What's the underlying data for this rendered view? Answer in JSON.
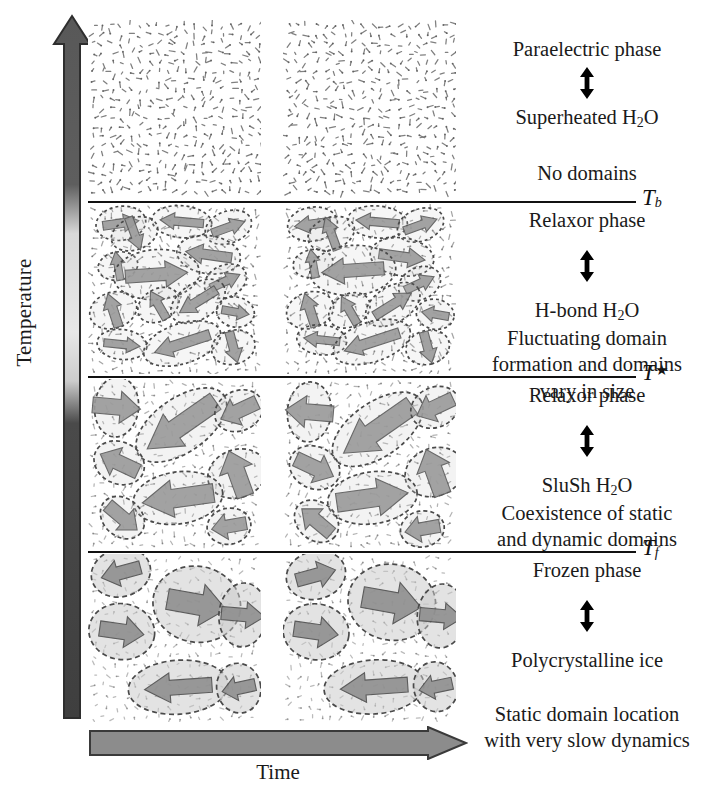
{
  "axes": {
    "temperature_label": "Temperature",
    "time_label": "Time",
    "temperature_arrow_direction": "up",
    "time_arrow_direction": "right",
    "arrow_fill": "#8c8c8c",
    "arrow_stroke": "#3a3a3a",
    "gradient_stops": [
      {
        "pos": 0,
        "color": "#585858"
      },
      {
        "pos": 24,
        "color": "#5e5e5e"
      },
      {
        "pos": 31,
        "color": "#d8d8d8"
      },
      {
        "pos": 45,
        "color": "#e8e8e8"
      },
      {
        "pos": 52,
        "color": "#cccccc"
      },
      {
        "pos": 58,
        "color": "#4a4a4a"
      },
      {
        "pos": 100,
        "color": "#3f3f3f"
      }
    ]
  },
  "boundaries": [
    {
      "id": "Tb",
      "symbol": "T",
      "subscript": "b",
      "superscript": "",
      "y": 201
    },
    {
      "id": "Tstar",
      "symbol": "T",
      "subscript": "",
      "superscript": "★",
      "y": 376
    },
    {
      "id": "Tf",
      "symbol": "T",
      "subscript": "f",
      "superscript": "",
      "y": 551
    }
  ],
  "regions": [
    {
      "id": "paraelectric",
      "phase": "Paraelectric phase",
      "analogue": "Superheated H2O",
      "analogue_pre": "Superheated H",
      "analogue_sub": "2",
      "analogue_post": "O",
      "description": "No domains",
      "description_lines": [
        "No domains"
      ],
      "panel": "dipole-grid",
      "top": 20,
      "height": 178
    },
    {
      "id": "relaxor-upper",
      "phase": "Relaxor phase",
      "analogue_pre": "H-bond H",
      "analogue_sub": "2",
      "analogue_post": "O",
      "description_lines": [
        "Fluctuating domain",
        "formation and domains",
        "vary in size"
      ],
      "panel": "fluctuating-domains",
      "top": 204,
      "height": 170
    },
    {
      "id": "relaxor-lower",
      "phase": "Relaxor phase",
      "analogue_pre": "SluSh H",
      "analogue_sub": "2",
      "analogue_post": "O",
      "description_lines": [
        "Coexistence of static",
        "and dynamic domains"
      ],
      "panel": "mixed-domains",
      "top": 379,
      "height": 170
    },
    {
      "id": "frozen",
      "phase": "Frozen phase",
      "analogue_pre": "Polycrystalline ice",
      "analogue_sub": "",
      "analogue_post": "",
      "description_lines": [
        "Static domain location",
        "with very slow dynamics"
      ],
      "panel": "static-domains",
      "top": 554,
      "height": 168
    }
  ],
  "text_blocks": [
    {
      "region": "paraelectric",
      "top": 36,
      "phase": "Paraelectric phase",
      "analogue_pre": "Superheated H",
      "analogue_sub": "2",
      "analogue_post": "O",
      "lines": [
        "No domains"
      ]
    },
    {
      "region": "relaxor-upper",
      "top": 207,
      "phase": "Relaxor phase",
      "analogue_pre": "H-bond H",
      "analogue_sub": "2",
      "analogue_post": "O",
      "lines": [
        "Fluctuating domain",
        "formation and domains",
        "vary in size"
      ]
    },
    {
      "region": "relaxor-lower",
      "top": 382,
      "phase": "Relaxor phase",
      "analogue_pre": "SluSh H",
      "analogue_sub": "2",
      "analogue_post": "O",
      "lines": [
        "Coexistence of static",
        "and dynamic domains"
      ]
    },
    {
      "region": "frozen",
      "top": 557,
      "phase": "Frozen phase",
      "analogue_pre": "Polycrystalline ice",
      "analogue_sub": "",
      "analogue_post": "",
      "lines": [
        "Static domain location",
        "with very slow dynamics"
      ]
    }
  ],
  "colors": {
    "line": "#111111",
    "text": "#1a1a1a",
    "domain_fill": "#c9c9c9",
    "domain_stroke": "#4a4a4a",
    "arrow_body": "#9a9a9a",
    "arrow_edge": "#5a5a5a",
    "background": "#ffffff"
  }
}
